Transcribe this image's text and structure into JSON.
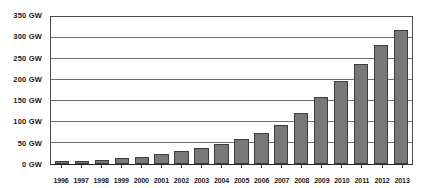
{
  "chart_data": {
    "type": "bar",
    "title": "",
    "xlabel": "",
    "ylabel": "",
    "ylim": [
      0,
      350
    ],
    "grid": true,
    "legend": "none",
    "unit": "GW",
    "categories": [
      "1996",
      "1997",
      "1998",
      "1999",
      "2000",
      "2001",
      "2002",
      "2003",
      "2004",
      "2005",
      "2006",
      "2007",
      "2008",
      "2009",
      "2010",
      "2011",
      "2012",
      "2013"
    ],
    "values": [
      6,
      8,
      10,
      14,
      17,
      24,
      31,
      39,
      47,
      59,
      74,
      94,
      121,
      159,
      198,
      238,
      283,
      318
    ],
    "series": [
      {
        "name": "Cumulative installed capacity",
        "values": [
          6,
          8,
          10,
          14,
          17,
          24,
          31,
          39,
          47,
          59,
          74,
          94,
          121,
          159,
          198,
          238,
          283,
          318
        ]
      }
    ],
    "y_ticks": [
      0,
      50,
      100,
      150,
      200,
      250,
      300,
      350
    ],
    "y_tick_labels": [
      "0 GW",
      "50 GW",
      "100 GW",
      "150 GW",
      "200 GW",
      "250 GW",
      "300 GW",
      "350 GW"
    ],
    "colors": {
      "bar_fill": "#787878",
      "bar_border": "#3d3d3d",
      "gridline": "#6e6e6e",
      "frame": "#4a4a4a",
      "text": "#1a1a1a",
      "background": "#ffffff"
    }
  }
}
